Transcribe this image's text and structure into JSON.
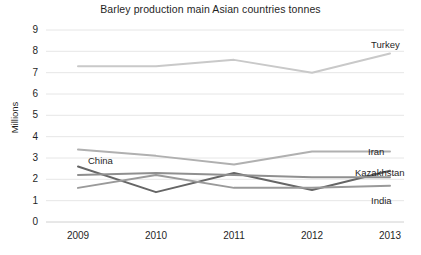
{
  "chart_data": {
    "type": "line",
    "title": "Barley production main Asian countries tonnes",
    "xlabel": "",
    "ylabel": "Millions",
    "categories": [
      "2009",
      "2010",
      "2011",
      "2012",
      "2013"
    ],
    "x": [
      2009,
      2010,
      2011,
      2012,
      2013
    ],
    "ylim": [
      0,
      9
    ],
    "yticks": [
      "0",
      "1",
      "2",
      "3",
      "4",
      "5",
      "6",
      "7",
      "8",
      "9"
    ],
    "grid": "horizontal",
    "legend_position": "inline-end-labels",
    "series": [
      {
        "name": "Turkey",
        "color": "#c9c9c9",
        "values": [
          7.3,
          7.3,
          7.6,
          7.0,
          7.9
        ]
      },
      {
        "name": "Iran",
        "color": "#b0b0b0",
        "values": [
          3.4,
          3.1,
          2.7,
          3.3,
          3.3
        ]
      },
      {
        "name": "Kazakhstan",
        "color": "#666666",
        "values": [
          2.6,
          1.4,
          2.3,
          1.5,
          2.4
        ]
      },
      {
        "name": "India",
        "color": "#9a9a9a",
        "values": [
          1.6,
          2.2,
          1.6,
          1.6,
          1.7
        ]
      },
      {
        "name": "China",
        "color": "#8f8f8f",
        "values": [
          2.2,
          2.3,
          2.2,
          2.1,
          2.1
        ]
      }
    ],
    "inline_labels": [
      {
        "text": "Turkey",
        "x": 371,
        "y": 40
      },
      {
        "text": "Iran",
        "x": 368,
        "y": 147
      },
      {
        "text": "Kazakhstan",
        "x": 358,
        "y": 168
      },
      {
        "text": "India",
        "x": 371,
        "y": 196
      },
      {
        "text": "China",
        "x": 88,
        "y": 156
      }
    ]
  }
}
